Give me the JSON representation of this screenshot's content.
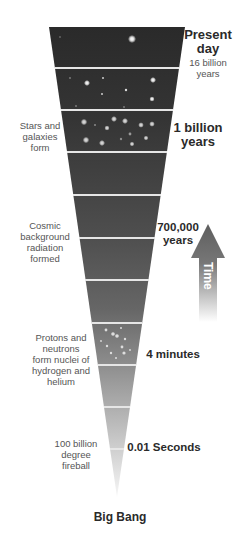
{
  "diagram": {
    "type": "timeline-funnel",
    "colors": {
      "top_band": "#2c2c2c",
      "middle_band": "#555555",
      "lower_band": "#a8a8a8",
      "tip": "#f4f4f4",
      "divider": "#e8e8e8",
      "arrow": "#6a6a6a",
      "text_dark": "#2a2a2a",
      "text_gray": "#555555"
    },
    "right_labels": [
      {
        "id": "present",
        "title": "Present\nday",
        "subtitle": "16 billion\nyears"
      },
      {
        "id": "billion",
        "title": "1 billion\nyears"
      },
      {
        "id": "k700",
        "title": "700,000\nyears"
      },
      {
        "id": "minutes",
        "title": "4 minutes"
      },
      {
        "id": "seconds",
        "title": "0.01 Seconds"
      }
    ],
    "left_labels": [
      {
        "id": "stars",
        "text": "Stars and\ngalaxies\nform"
      },
      {
        "id": "cmb",
        "text": "Cosmic\nbackground\nradiation\nformed"
      },
      {
        "id": "nuclei",
        "text": "Protons and\nneutrons\nform nuclei of\nhydrogen and\nhelium"
      },
      {
        "id": "fireball",
        "text": "100 billion\ndegree\nfireball"
      }
    ],
    "bottom_label": "Big Bang",
    "arrow_label": "Time"
  }
}
